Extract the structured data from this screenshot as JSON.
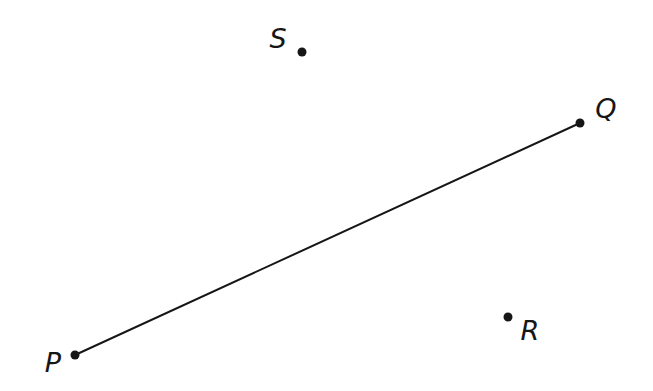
{
  "figure": {
    "type": "geometry-points-and-segment",
    "background_color": "#ffffff",
    "ink_color": "#161616",
    "canvas_width": 653,
    "canvas_height": 391,
    "dot_radius": 4.5,
    "line_width": 2,
    "points": [
      {
        "id": "P",
        "label": "P",
        "x": 75,
        "y": 355,
        "label_x": 53,
        "label_y": 362,
        "label_position": "left-of-dot"
      },
      {
        "id": "Q",
        "label": "Q",
        "x": 580,
        "y": 123,
        "label_x": 606,
        "label_y": 108,
        "label_position": "upper-right-of-dot"
      },
      {
        "id": "S",
        "label": "S",
        "x": 302,
        "y": 52,
        "label_x": 278,
        "label_y": 38,
        "label_position": "upper-left-of-dot"
      },
      {
        "id": "R",
        "label": "R",
        "x": 508,
        "y": 317,
        "label_x": 530,
        "label_y": 330,
        "label_position": "lower-right-of-dot"
      }
    ],
    "segments": [
      {
        "from": "P",
        "to": "Q"
      }
    ]
  }
}
